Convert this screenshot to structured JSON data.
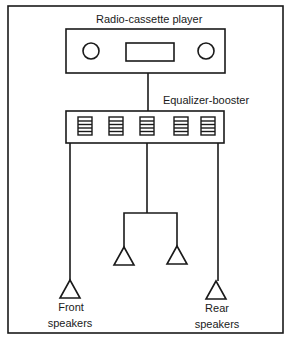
{
  "diagram": {
    "title_device": "Radio-cassette player",
    "equalizer_label": "Equalizer-booster",
    "front_label_line1": "Front",
    "front_label_line2": "speakers",
    "rear_label_line1": "Rear",
    "rear_label_line2": "speakers",
    "components": [
      {
        "name": "Radio-cassette player",
        "connects_to": "Equalizer-booster"
      },
      {
        "name": "Equalizer-booster",
        "sliders": 5,
        "outputs": [
          "Front speakers",
          "Center speaker pair",
          "Rear speakers"
        ]
      },
      {
        "name": "Front speakers",
        "count": 1
      },
      {
        "name": "Center speakers",
        "count": 2
      },
      {
        "name": "Rear speakers",
        "count": 1
      }
    ],
    "colors": {
      "line": "#1a1a1a",
      "background": "#ffffff"
    }
  }
}
